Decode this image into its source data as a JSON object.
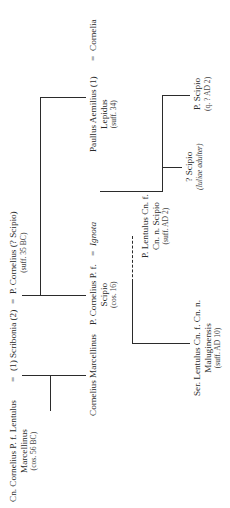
{
  "diagram": {
    "type": "genealogical-stemma",
    "orientation": "rotated -90deg (reads bottom to top)",
    "generation_1": {
      "lentulus": {
        "line1": "Cn. Cornelius P. f. Lentulus",
        "line2": "Marcellinus",
        "date": "(cos. 56 BC)"
      },
      "scribonia": {
        "label": "(1) Scribonia (2)"
      },
      "cornelius": {
        "line1": "P. Cornelius (? Scipio)",
        "date": "(suff. 35 BC)"
      },
      "marriage_symbol": "="
    },
    "generation_2": {
      "marcellinus": {
        "line1": "Cornelius Marcellinus"
      },
      "scipio": {
        "line1": "P. Cornelius P. f.",
        "line2": "Scipio",
        "date": "(cos. 16)"
      },
      "ignota": {
        "label": "Ignota"
      },
      "paullus": {
        "line1": "Paullus Aemilius (1)",
        "line2": "Lepidus",
        "date": "(suff. 34)"
      },
      "cornelia": {
        "label": "Cornelia"
      }
    },
    "generation_3": {
      "maluginensis": {
        "line1": "Ser. Lentulus Cn. f. Cn. n.",
        "line2": "Maluginensis",
        "date": "(suff. AD 10)"
      },
      "lentulus_scipio": {
        "line1": "P. Lentulus Cn. f.",
        "line2": "Cn. n. Scipio",
        "date": "(suff. AD 2)"
      },
      "q_scipio": {
        "line1": "? Scipio",
        "date": "(Iuliae adulter)"
      },
      "p_scipio": {
        "line1": "P. Scipio",
        "date": "(q. ? AD 2)"
      }
    }
  }
}
